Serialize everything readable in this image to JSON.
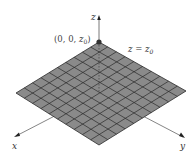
{
  "figure": {
    "type": "3d-plane-illustration",
    "grid_divisions": 10,
    "plane_color": "#8a8a8a",
    "grid_line_color": "#2a2a2a",
    "axis_color": "#555555"
  },
  "labels": {
    "z_axis": "z",
    "x_axis": "x",
    "y_axis": "y",
    "point_prefix": "(0, 0, ",
    "point_var": "z",
    "point_sub": "0",
    "point_suffix": ")",
    "plane_eq_lhs": "z = z",
    "plane_eq_sub": "0"
  }
}
